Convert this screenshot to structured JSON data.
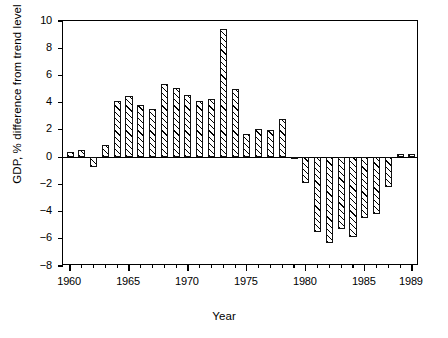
{
  "chart_data": {
    "type": "bar",
    "title": "",
    "xlabel": "Year",
    "ylabel": "GDP, % difference from trend level",
    "xlim": [
      1959.4,
      1989.6
    ],
    "ylim": [
      -8,
      10
    ],
    "grid": false,
    "legend": null,
    "y_ticks": [
      10,
      8,
      6,
      4,
      2,
      0,
      -2,
      -4,
      -6,
      -8
    ],
    "y_tick_labels": [
      "10",
      "8",
      "6",
      "4",
      "2",
      "0",
      "−2",
      "−4",
      "−6",
      "−8"
    ],
    "x_ticks": [
      1960,
      1961,
      1962,
      1963,
      1964,
      1965,
      1966,
      1967,
      1968,
      1969,
      1970,
      1971,
      1972,
      1973,
      1974,
      1975,
      1976,
      1977,
      1978,
      1979,
      1980,
      1981,
      1982,
      1983,
      1984,
      1985,
      1986,
      1987,
      1988,
      1989
    ],
    "x_tick_labels": [
      "1960",
      "1965",
      "1970",
      "1975",
      "1980",
      "1985",
      "1989"
    ],
    "x_labelled_ticks": [
      1960,
      1965,
      1970,
      1975,
      1980,
      1985,
      1989
    ],
    "categories": [
      1960,
      1961,
      1962,
      1963,
      1964,
      1965,
      1966,
      1967,
      1968,
      1969,
      1970,
      1971,
      1972,
      1973,
      1974,
      1975,
      1976,
      1977,
      1978,
      1979,
      1980,
      1981,
      1982,
      1983,
      1984,
      1985,
      1986,
      1987,
      1988,
      1989
    ],
    "values": [
      0.4,
      0.5,
      -0.7,
      0.9,
      4.1,
      4.5,
      3.8,
      3.5,
      5.4,
      5.1,
      4.6,
      4.1,
      4.3,
      9.4,
      5.0,
      1.7,
      2.1,
      2.0,
      2.8,
      0.0,
      -1.9,
      -5.5,
      -6.3,
      -5.3,
      -5.9,
      -4.5,
      -4.2,
      -2.2,
      0.2,
      0.2
    ],
    "bar_style": {
      "fill": "#ffffff",
      "edge": "#111111",
      "hatch": "diagonal-45"
    }
  },
  "axes": {
    "y_title": "GDP, % difference from trend level",
    "x_title": "Year"
  }
}
